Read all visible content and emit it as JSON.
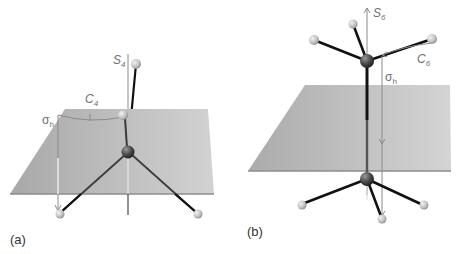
{
  "figure": {
    "background": "#ffffff",
    "plane_color": "#b9b9b9",
    "plane_edge_color": "#8d8d8d",
    "bond_color": "#111111",
    "axis_color": "#8a8a8a",
    "central_atom_color": "#555555",
    "ligand_atom_color": "#c8c8c8"
  },
  "panels": [
    {
      "id": "a",
      "label": "(a)",
      "axis_label": "S",
      "axis_subscript": "4",
      "rotation_label": "C",
      "rotation_subscript": "4",
      "mirror_label": "σ",
      "mirror_subscript": "h",
      "plane": {
        "top_left": [
          65,
          109
        ],
        "top_right": [
          208,
          109
        ],
        "bottom_right": [
          214,
          194
        ],
        "bottom_left": [
          10,
          194
        ]
      },
      "central_atom": [
        128,
        152
      ],
      "ligands": [
        [
          136,
          64
        ],
        [
          123,
          115
        ],
        [
          60,
          213
        ],
        [
          197,
          213
        ]
      ]
    },
    {
      "id": "b",
      "label": "(b)",
      "axis_label": "S",
      "axis_subscript": "6",
      "rotation_label": "C",
      "rotation_subscript": "6",
      "mirror_label": "σ",
      "mirror_subscript": "h",
      "plane": {
        "top_left": [
          305,
          85
        ],
        "top_right": [
          450,
          85
        ],
        "bottom_right": [
          451,
          171
        ],
        "bottom_left": [
          248,
          171
        ]
      },
      "upper_atom": [
        367,
        61
      ],
      "lower_atom": [
        367,
        179
      ],
      "upper_ligands": [
        [
          314,
          40
        ],
        [
          353,
          24
        ],
        [
          432,
          39
        ]
      ],
      "lower_ligands": [
        [
          302,
          204
        ],
        [
          423,
          205
        ],
        [
          382,
          219
        ]
      ]
    }
  ]
}
